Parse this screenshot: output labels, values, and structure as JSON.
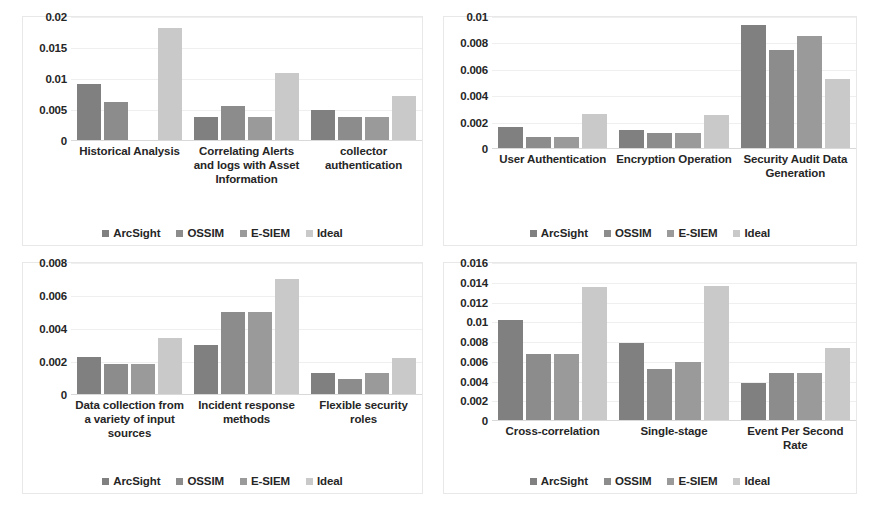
{
  "figure": {
    "series_colors": [
      "#808080",
      "#8c8c8c",
      "#9a9a9a",
      "#c9c9c9"
    ],
    "series_names": [
      "ArcSight",
      "OSSIM",
      "E-SIEM",
      "Ideal"
    ]
  },
  "chart_data": [
    {
      "id": "top-left",
      "type": "bar",
      "title": "",
      "xlabel": "",
      "ylabel": "",
      "grid": true,
      "legend_position": "bottom",
      "ylim": [
        0,
        0.02
      ],
      "yticks": [
        0,
        0.005,
        0.01,
        0.015,
        0.02
      ],
      "ytick_labels": [
        "0",
        "0.005",
        "0.01",
        "0.015",
        "0.02"
      ],
      "categories": [
        "Historical Analysis",
        "Correlating Alerts and logs with Asset Information",
        "collector authentication"
      ],
      "series": [
        {
          "name": "ArcSight",
          "values": [
            0.009,
            0.0037,
            0.0048
          ]
        },
        {
          "name": "OSSIM",
          "values": [
            0.0061,
            0.0055,
            0.0037
          ]
        },
        {
          "name": "E-SIEM",
          "values": [
            0.0,
            0.0037,
            0.0037
          ]
        },
        {
          "name": "Ideal",
          "values": [
            0.018,
            0.0108,
            0.0071
          ]
        }
      ]
    },
    {
      "id": "top-right",
      "type": "bar",
      "title": "",
      "xlabel": "",
      "ylabel": "",
      "grid": true,
      "legend_position": "bottom",
      "ylim": [
        0,
        0.01
      ],
      "yticks": [
        0,
        0.002,
        0.004,
        0.006,
        0.008,
        0.01
      ],
      "ytick_labels": [
        "0",
        "0.002",
        "0.004",
        "0.006",
        "0.008",
        "0.01"
      ],
      "categories": [
        "User Authentication",
        "Encryption Operation",
        "Security Audit Data Generation"
      ],
      "series": [
        {
          "name": "ArcSight",
          "values": [
            0.0016,
            0.0014,
            0.0093
          ]
        },
        {
          "name": "OSSIM",
          "values": [
            0.0008,
            0.0011,
            0.0074
          ]
        },
        {
          "name": "E-SIEM",
          "values": [
            0.0008,
            0.0011,
            0.0085
          ]
        },
        {
          "name": "Ideal",
          "values": [
            0.0026,
            0.0025,
            0.0052
          ]
        }
      ]
    },
    {
      "id": "bottom-left",
      "type": "bar",
      "title": "",
      "xlabel": "",
      "ylabel": "",
      "grid": true,
      "legend_position": "bottom",
      "ylim": [
        0,
        0.008
      ],
      "yticks": [
        0,
        0.002,
        0.004,
        0.006,
        0.008
      ],
      "ytick_labels": [
        "0",
        "0.002",
        "0.004",
        "0.006",
        "0.008"
      ],
      "categories": [
        "Data collection from a variety of input sources",
        "Incident response methods",
        "Flexible security roles"
      ],
      "series": [
        {
          "name": "ArcSight",
          "values": [
            0.00225,
            0.003,
            0.0013
          ]
        },
        {
          "name": "OSSIM",
          "values": [
            0.0018,
            0.005,
            0.0009
          ]
        },
        {
          "name": "E-SIEM",
          "values": [
            0.0018,
            0.005,
            0.0013
          ]
        },
        {
          "name": "Ideal",
          "values": [
            0.0034,
            0.007,
            0.0022
          ]
        }
      ]
    },
    {
      "id": "bottom-right",
      "type": "bar",
      "title": "",
      "xlabel": "",
      "ylabel": "",
      "grid": true,
      "legend_position": "bottom",
      "ylim": [
        0,
        0.016
      ],
      "yticks": [
        0,
        0.002,
        0.004,
        0.006,
        0.008,
        0.01,
        0.012,
        0.014,
        0.016
      ],
      "ytick_labels": [
        "0",
        "0.002",
        "0.004",
        "0.006",
        "0.008",
        "0.01",
        "0.012",
        "0.014",
        "0.016"
      ],
      "categories": [
        "Cross-correlation",
        "Single-stage",
        "Event Per Second Rate"
      ],
      "series": [
        {
          "name": "ArcSight",
          "values": [
            0.0101,
            0.0078,
            0.0037
          ]
        },
        {
          "name": "OSSIM",
          "values": [
            0.0067,
            0.0052,
            0.0048
          ]
        },
        {
          "name": "E-SIEM",
          "values": [
            0.0067,
            0.0059,
            0.0048
          ]
        },
        {
          "name": "Ideal",
          "values": [
            0.0135,
            0.0136,
            0.0073
          ]
        }
      ]
    }
  ]
}
